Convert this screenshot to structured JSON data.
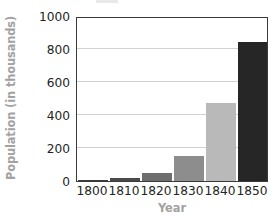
{
  "chart_data": {
    "type": "bar",
    "title": "",
    "xlabel": "Year",
    "ylabel": "Population (in thousands)",
    "categories": [
      "1800",
      "1810",
      "1820",
      "1830",
      "1840",
      "1850"
    ],
    "values": [
      8,
      18,
      50,
      150,
      470,
      840
    ],
    "bar_colors": [
      "#3d3d3d",
      "#4a4a4a",
      "#6e6e6e",
      "#8d8d8d",
      "#b9b9b9",
      "#262626"
    ],
    "ylim": [
      0,
      1000
    ],
    "yticks": [
      0,
      200,
      400,
      600,
      800,
      1000
    ],
    "ytick_labels": [
      "0",
      "200",
      "400",
      "600",
      "800",
      "1000"
    ],
    "grid": true,
    "grid_axis": "y",
    "legend": "none",
    "legend_position": "none",
    "axis_label_color": "#a2a2a2",
    "tick_label_color": "#232323",
    "gridline_color": "#d2d2d2",
    "frame_color": "#3a3a3a",
    "background_color": "#ffffff"
  }
}
